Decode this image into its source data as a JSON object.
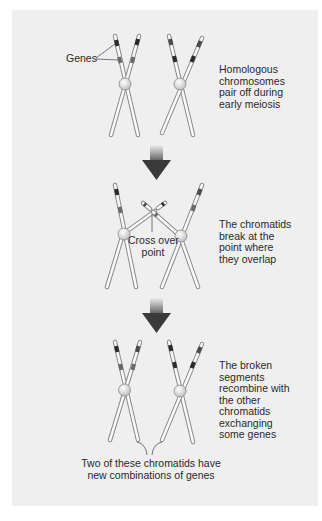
{
  "diagram": {
    "stages": [
      {
        "caption_lines": [
          "Homologous",
          "chromosomes",
          "pair off during",
          "early meiosis"
        ]
      },
      {
        "caption_lines": [
          "The chromatids",
          "break at the",
          "point where",
          "they overlap"
        ],
        "pointer_label_lines": [
          "Cross over",
          "point"
        ]
      },
      {
        "caption_lines": [
          "The broken",
          "segments",
          "recombine with",
          "the other",
          "chromatids",
          "exchanging",
          "some genes"
        ],
        "bottom_label_lines": [
          "Two of these chromatids have",
          "new combinations of genes"
        ]
      }
    ],
    "genes_label": "Genes",
    "colors": {
      "background": "#efefef",
      "chromatid_fill": "#fafafa",
      "chromatid_stroke": "#8a8a8a",
      "gene_band_dark": "#2b2b2b",
      "gene_band_mid": "#6a6a6a",
      "centromere": "#d8d8d8",
      "arrow_top": "#e6e6e6",
      "arrow_bottom": "#3a3a3a",
      "text": "#2a2a2a"
    }
  }
}
